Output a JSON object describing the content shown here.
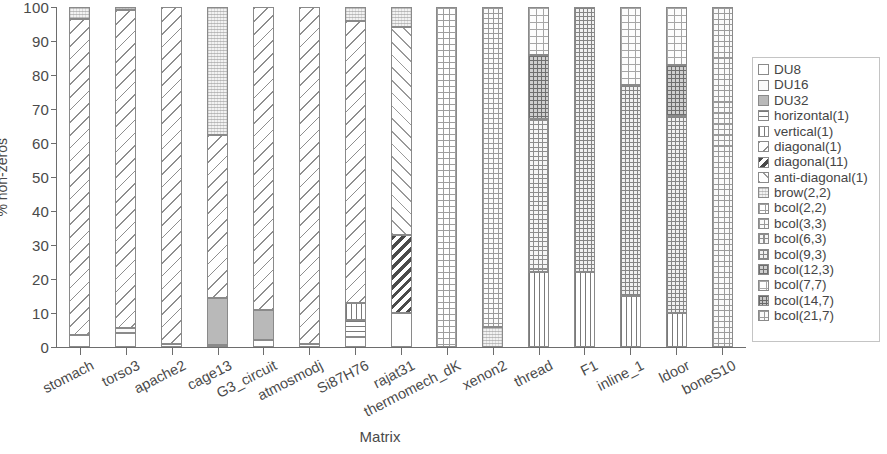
{
  "chart_data": {
    "type": "bar",
    "subtype": "stacked-bar-100-percent",
    "title": "",
    "xlabel": "Matrix",
    "ylabel": "% non-zeros",
    "ylim": [
      0,
      100
    ],
    "yticks": [
      0,
      10,
      20,
      30,
      40,
      50,
      60,
      70,
      80,
      90,
      100
    ],
    "ytick_labels": [
      "0",
      "10",
      "20",
      "30",
      "40",
      "50",
      "60",
      "70",
      "80",
      "90",
      "100"
    ],
    "grid": false,
    "legend_position": "right-outside",
    "categories": [
      "stomach",
      "torso3",
      "apache2",
      "cage13",
      "G3_circuit",
      "atmosmodj",
      "Si87H76",
      "rajat31",
      "thermomech_dK",
      "xenon2",
      "thread",
      "F1",
      "inline_1",
      "ldoor",
      "boneS10"
    ],
    "series": [
      {
        "name": "DU8",
        "pattern": "p-du8",
        "values": [
          3.5,
          4.0,
          1.0,
          0.5,
          2.0,
          1.0,
          3.0,
          10.0,
          0.0,
          0.0,
          0.0,
          0.0,
          0.0,
          0.0,
          0.0
        ]
      },
      {
        "name": "DU16",
        "pattern": "p-du16",
        "values": [
          0.0,
          1.5,
          0.0,
          0.0,
          0.0,
          0.0,
          0.0,
          0.0,
          0.0,
          0.0,
          0.0,
          0.0,
          0.0,
          0.0,
          0.0
        ]
      },
      {
        "name": "DU32",
        "pattern": "p-du32",
        "values": [
          0.0,
          0.0,
          0.0,
          14.0,
          9.0,
          0.0,
          0.0,
          0.0,
          0.0,
          0.0,
          0.0,
          0.0,
          0.0,
          0.0,
          0.0
        ]
      },
      {
        "name": "horizontal(1)",
        "pattern": "p-horizontal",
        "values": [
          0.0,
          0.0,
          0.0,
          0.0,
          0.0,
          0.0,
          5.0,
          0.0,
          0.0,
          0.0,
          0.0,
          0.0,
          0.0,
          0.0,
          0.0
        ]
      },
      {
        "name": "vertical(1)",
        "pattern": "p-vertical",
        "values": [
          0.0,
          0.0,
          0.0,
          0.0,
          0.0,
          0.0,
          5.0,
          0.0,
          0.0,
          0.0,
          22.0,
          22.0,
          15.0,
          10.0,
          0.0
        ]
      },
      {
        "name": "diagonal(1)",
        "pattern": "p-diagonal1",
        "values": [
          93.0,
          93.5,
          99.0,
          48.0,
          89.0,
          99.0,
          83.0,
          0.0,
          0.0,
          0.0,
          0.0,
          0.0,
          0.0,
          0.0,
          0.0
        ]
      },
      {
        "name": "diagonal(11)",
        "pattern": "p-diagonal11",
        "values": [
          0.0,
          0.0,
          0.0,
          0.0,
          0.0,
          0.0,
          0.0,
          23.0,
          0.0,
          0.0,
          0.0,
          0.0,
          0.0,
          0.0,
          0.0
        ]
      },
      {
        "name": "anti-diagonal(1)",
        "pattern": "p-antidiagonal1",
        "values": [
          0.0,
          0.0,
          0.0,
          0.0,
          0.0,
          0.0,
          0.0,
          61.0,
          0.0,
          0.0,
          0.0,
          0.0,
          0.0,
          0.0,
          0.0
        ]
      },
      {
        "name": "brow(2,2)",
        "pattern": "p-brow",
        "values": [
          3.5,
          1.0,
          0.0,
          37.5,
          0.0,
          0.0,
          4.0,
          6.0,
          0.0,
          6.0,
          0.0,
          0.0,
          0.0,
          0.0,
          0.0
        ]
      },
      {
        "name": "bcol(2,2)",
        "pattern": "p-grid-a",
        "values": [
          0.0,
          0.0,
          0.0,
          0.0,
          0.0,
          0.0,
          0.0,
          0.0,
          100.0,
          0.0,
          0.0,
          0.0,
          0.0,
          0.0,
          0.0
        ]
      },
      {
        "name": "bcol(3,3)",
        "pattern": "p-grid-b",
        "values": [
          0.0,
          0.0,
          0.0,
          0.0,
          0.0,
          0.0,
          0.0,
          0.0,
          0.0,
          94.0,
          0.0,
          0.0,
          0.0,
          0.0,
          0.0
        ]
      },
      {
        "name": "bcol(6,3)",
        "pattern": "p-grid-c",
        "values": [
          0.0,
          0.0,
          0.0,
          0.0,
          0.0,
          0.0,
          0.0,
          0.0,
          0.0,
          0.0,
          45.0,
          0.0,
          0.0,
          0.0,
          0.0
        ]
      },
      {
        "name": "bcol(9,3)",
        "pattern": "p-grid-d",
        "values": [
          0.0,
          0.0,
          0.0,
          0.0,
          0.0,
          0.0,
          0.0,
          0.0,
          0.0,
          0.0,
          0.0,
          78.0,
          62.0,
          58.0,
          0.0
        ]
      },
      {
        "name": "bcol(12,3)",
        "pattern": "p-grid-e",
        "values": [
          0.0,
          0.0,
          0.0,
          0.0,
          0.0,
          0.0,
          0.0,
          0.0,
          0.0,
          0.0,
          19.0,
          0.0,
          0.0,
          15.0,
          0.0
        ]
      },
      {
        "name": "bcol(7,7)",
        "pattern": "p-grid-f",
        "values": [
          0.0,
          0.0,
          0.0,
          0.0,
          0.0,
          0.0,
          0.0,
          0.0,
          0.0,
          0.0,
          14.0,
          0.0,
          23.0,
          17.0,
          0.0
        ]
      },
      {
        "name": "bcol(14,7)",
        "pattern": "p-grid-g",
        "values": [
          0.0,
          0.0,
          0.0,
          0.0,
          0.0,
          0.0,
          0.0,
          0.0,
          0.0,
          0.0,
          0.0,
          0.0,
          0.0,
          0.0,
          0.0
        ]
      },
      {
        "name": "bcol(21,7)",
        "pattern": "p-grid-h",
        "values": [
          0.0,
          0.0,
          0.0,
          0.0,
          0.0,
          0.0,
          0.0,
          0.0,
          0.0,
          0.0,
          0.0,
          0.0,
          0.0,
          0.0,
          100.0
        ]
      }
    ]
  },
  "legend": {
    "items": [
      {
        "label": "DU8",
        "pattern": "p-du8"
      },
      {
        "label": "DU16",
        "pattern": "p-du16"
      },
      {
        "label": "DU32",
        "pattern": "p-du32"
      },
      {
        "label": "horizontal(1)",
        "pattern": "p-horizontal"
      },
      {
        "label": "vertical(1)",
        "pattern": "p-vertical"
      },
      {
        "label": "diagonal(1)",
        "pattern": "p-diagonal1"
      },
      {
        "label": "diagonal(11)",
        "pattern": "p-diagonal11"
      },
      {
        "label": "anti-diagonal(1)",
        "pattern": "p-antidiagonal1"
      },
      {
        "label": "brow(2,2)",
        "pattern": "p-brow"
      },
      {
        "label": "bcol(2,2)",
        "pattern": "p-grid-a"
      },
      {
        "label": "bcol(3,3)",
        "pattern": "p-grid-b"
      },
      {
        "label": "bcol(6,3)",
        "pattern": "p-grid-c"
      },
      {
        "label": "bcol(9,3)",
        "pattern": "p-grid-d"
      },
      {
        "label": "bcol(12,3)",
        "pattern": "p-grid-e"
      },
      {
        "label": "bcol(7,7)",
        "pattern": "p-grid-f"
      },
      {
        "label": "bcol(14,7)",
        "pattern": "p-grid-g"
      },
      {
        "label": "bcol(21,7)",
        "pattern": "p-grid-h"
      }
    ]
  },
  "colors": {
    "axis": "#6d6d6d",
    "text": "#4a4a4a",
    "legend_border": "#c4c4c4",
    "bar_border": "#8a8a8a",
    "background": "#ffffff"
  }
}
